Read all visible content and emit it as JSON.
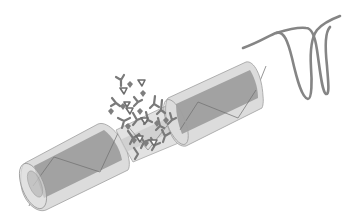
{
  "figure": {
    "components": [
      {
        "id": "left-fiber-segment",
        "label": ""
      },
      {
        "id": "tapered-region",
        "label": ""
      },
      {
        "id": "right-fiber-segment",
        "label": ""
      },
      {
        "id": "bioreceptor-cloud",
        "label": ""
      },
      {
        "id": "spectrum-dips",
        "label": ""
      }
    ],
    "spectrum": {
      "dip_count": 2,
      "note": "Two overlapping dips indicating wavelength shift"
    }
  },
  "colors": {
    "cladding": "#d6d6d6",
    "cladding_edge": "#9a9a9a",
    "core": "#9c9c9c",
    "molecule": "#7a7a7a",
    "spectrum_line": "#808080",
    "background": "#ffffff"
  }
}
